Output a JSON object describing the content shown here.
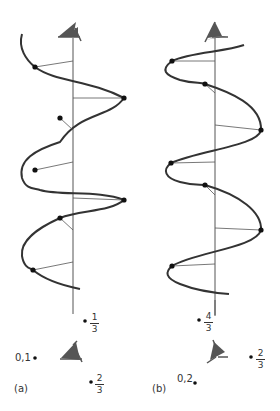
{
  "colors": {
    "curve": "#333333",
    "axis": "#555555",
    "marker": "#555555",
    "dot": "#111111"
  },
  "panels": {
    "a": {
      "label": "(a)",
      "point_label_01": "0,1",
      "frac_top": {
        "num": "1",
        "den": "3"
      },
      "frac_bottom": {
        "num": "2",
        "den": "3"
      }
    },
    "b": {
      "label": "(b)",
      "point_label_02": "0,2",
      "frac_top": {
        "num": "4",
        "den": "3"
      },
      "frac_right": {
        "num": "2",
        "den": "3"
      }
    }
  }
}
